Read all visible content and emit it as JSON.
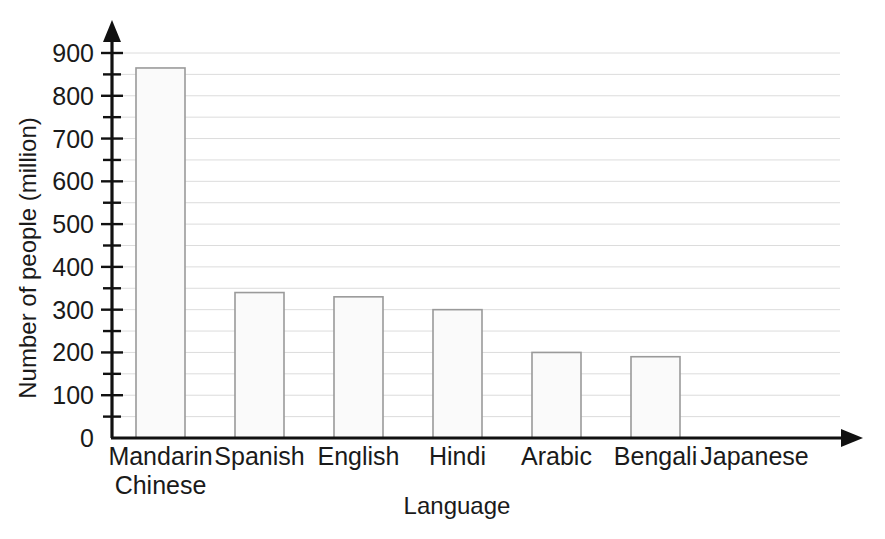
{
  "chart_data": {
    "type": "bar",
    "title": "",
    "subtitle": "",
    "xlabel": "Language",
    "ylabel": "Number of people (million)",
    "categories": [
      "Mandarin Chinese",
      "Spanish",
      "English",
      "Hindi",
      "Arabic",
      "Bengali",
      "Japanese"
    ],
    "category_lines": [
      [
        "Mandarin",
        "Chinese"
      ],
      [
        "Spanish"
      ],
      [
        "English"
      ],
      [
        "Hindi"
      ],
      [
        "Arabic"
      ],
      [
        "Bengali"
      ],
      [
        "Japanese"
      ]
    ],
    "values": [
      865,
      340,
      330,
      300,
      200,
      190,
      0
    ],
    "ylim": [
      0,
      900
    ],
    "y_major_step": 100,
    "y_minor_step": 50,
    "y_tick_labels": [
      "0",
      "100",
      "200",
      "300",
      "400",
      "500",
      "600",
      "700",
      "800",
      "900"
    ],
    "grid": true,
    "grid_orientation": "horizontal",
    "legend": "none",
    "axis_arrows": true,
    "bar_fill_color": "#fafafa",
    "bar_edge_color": "#9a9a9a",
    "gridline_color": "#dcdcdc",
    "axis_color": "#111111",
    "background_color": "#ffffff"
  },
  "geometry": {
    "plot_left": 112,
    "plot_right": 840,
    "baseline_y": 438,
    "top_value_y": 53,
    "top_value": 900,
    "bar_width": 49,
    "bar_centers": [
      160.5,
      259.5,
      358.5,
      457.5,
      556.5,
      655.5,
      754.5
    ],
    "x_axis_arrow_tip": 863,
    "y_axis_arrow_tip": 20
  }
}
